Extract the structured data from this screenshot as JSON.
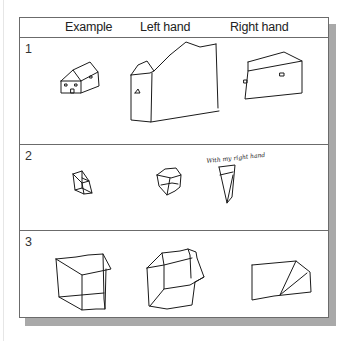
{
  "header": {
    "columns": [
      "Example",
      "Left hand",
      "Right hand"
    ]
  },
  "rows": [
    {
      "number": "1",
      "subject": "house",
      "example": "house drawing",
      "left_hand": "distorted house drawing",
      "right_hand": "flattened house drawing"
    },
    {
      "number": "2",
      "subject": "small cube",
      "example": "cube drawing",
      "left_hand": "distorted cube drawing",
      "right_hand": "flattened cube drawing",
      "annotation": "With my right hand"
    },
    {
      "number": "3",
      "subject": "large cube",
      "example": "cube drawing",
      "left_hand": "distorted cube drawing",
      "right_hand": "flattened cube drawing"
    }
  ],
  "colors": {
    "border": "#6b6b6b",
    "shadow": "#a9a9a9",
    "ink": "#1a1a1a"
  }
}
